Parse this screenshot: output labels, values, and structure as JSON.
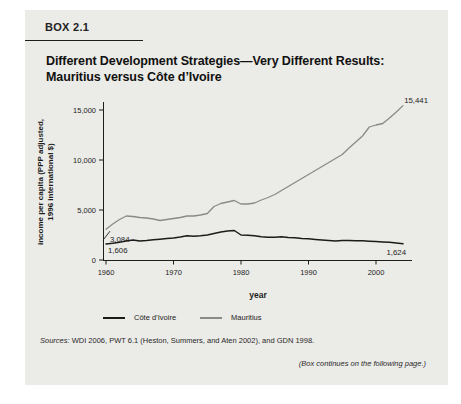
{
  "box": {
    "label": "BOX 2.1",
    "title_line1": "Different Development Strategies—Very Different Results:",
    "title_line2": "Mauritius versus Côte d’Ivoire",
    "sources_prefix": "Sources:",
    "sources_rest": " WDI 2006, PWT 6.1 (Heston, Summers, and Aten 2002), and GDN 1998.",
    "continues_note": "(Box continues on the following page.)"
  },
  "chart_data": {
    "type": "line",
    "title": "",
    "xlabel": "year",
    "ylabel": "income per capita (PPP adjusted, 1996 international $)",
    "ylabel_lines": [
      "income per capita (PPP adjusted,",
      "1996 international $)"
    ],
    "xlim": [
      1960,
      2004
    ],
    "ylim": [
      0,
      15500
    ],
    "grid": false,
    "legend_position": "bottom",
    "xticks": [
      1960,
      1970,
      1980,
      1990,
      2000
    ],
    "yticks": [
      "0",
      "5,000",
      "10,000",
      "15,000"
    ],
    "ytick_values": [
      0,
      5000,
      10000,
      15000
    ],
    "x": [
      1960,
      1961,
      1962,
      1963,
      1964,
      1965,
      1966,
      1967,
      1968,
      1969,
      1970,
      1971,
      1972,
      1973,
      1974,
      1975,
      1976,
      1977,
      1978,
      1979,
      1980,
      1981,
      1982,
      1983,
      1984,
      1985,
      1986,
      1987,
      1988,
      1989,
      1990,
      1991,
      1992,
      1993,
      1994,
      1995,
      1996,
      1997,
      1998,
      1999,
      2000,
      2001,
      2002,
      2003,
      2004
    ],
    "series": [
      {
        "name": "Côte d’Ivoire",
        "color": "#1b1b1b",
        "values": [
          1606,
          1680,
          1780,
          1900,
          2000,
          1900,
          1950,
          2020,
          2080,
          2150,
          2200,
          2300,
          2420,
          2380,
          2420,
          2500,
          2650,
          2800,
          2900,
          2950,
          2500,
          2480,
          2420,
          2320,
          2280,
          2280,
          2320,
          2260,
          2220,
          2160,
          2120,
          2060,
          2010,
          1960,
          1900,
          1950,
          1960,
          1930,
          1920,
          1880,
          1850,
          1810,
          1770,
          1700,
          1624
        ]
      },
      {
        "name": "Mauritius",
        "color": "#8a8a8a",
        "values": [
          3084,
          3600,
          4050,
          4400,
          4350,
          4250,
          4200,
          4100,
          3950,
          4050,
          4150,
          4250,
          4400,
          4400,
          4500,
          4650,
          5350,
          5650,
          5800,
          5950,
          5600,
          5600,
          5700,
          6000,
          6250,
          6550,
          6950,
          7350,
          7750,
          8150,
          8550,
          8950,
          9350,
          9750,
          10150,
          10550,
          11200,
          11800,
          12400,
          13300,
          13500,
          13650,
          14200,
          14800,
          15441
        ]
      }
    ],
    "annotations": [
      {
        "text": "15,441",
        "series": "Mauritius",
        "year": 2004,
        "value": 15441,
        "dx": 25,
        "dy": -3,
        "anchor": "end",
        "leader": false
      },
      {
        "text": "3,084",
        "series": "Mauritius",
        "year": 1960,
        "value": 3084,
        "dx": 4,
        "dy": 13,
        "anchor": "start",
        "leader": true
      },
      {
        "text": "1,606",
        "series": "Côte d’Ivoire",
        "year": 1960,
        "value": 1606,
        "dx": 2,
        "dy": 9,
        "anchor": "start",
        "leader": false
      },
      {
        "text": "1,624",
        "series": "Côte d’Ivoire",
        "year": 2004,
        "value": 1624,
        "dx": 3,
        "dy": 11,
        "anchor": "end",
        "leader": false
      }
    ]
  },
  "colors": {
    "box_background": "#ebebe7",
    "page_background": "#ffffff",
    "axis": "#1d1d1d",
    "cote_divoire_line": "#1b1b1b",
    "mauritius_line": "#8a8a8a"
  }
}
